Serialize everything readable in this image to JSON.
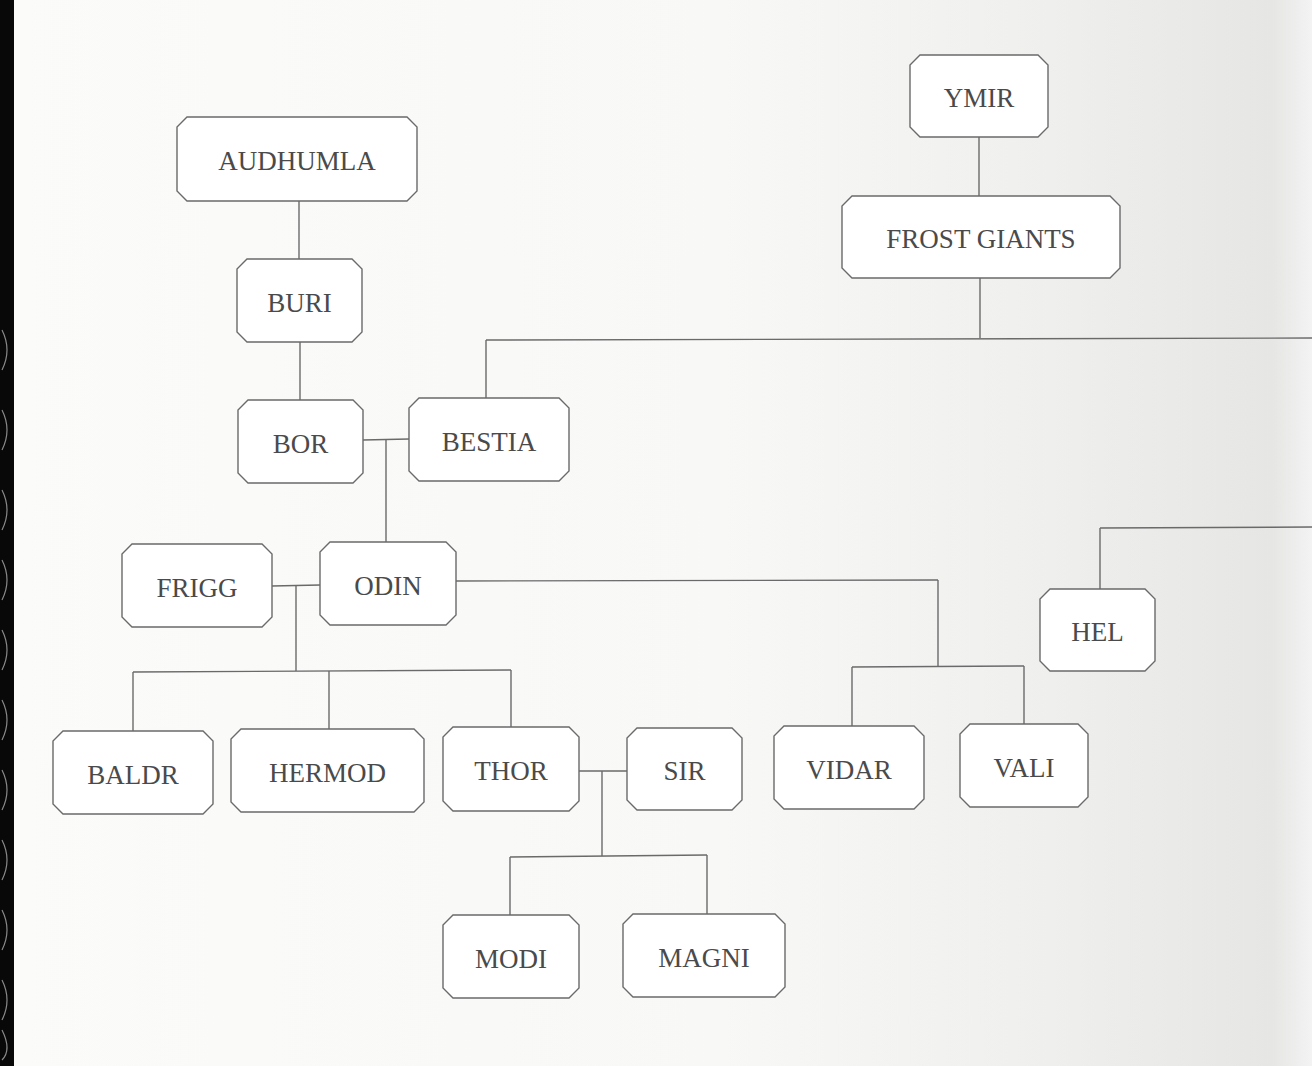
{
  "page": {
    "title_fragment": "",
    "content_type": "family tree diagram"
  },
  "nodes": [
    {
      "id": "ymir",
      "label": "YMIR"
    },
    {
      "id": "frost-giants",
      "label": "FROST GIANTS"
    },
    {
      "id": "audhumla",
      "label": "AUDHUMLA"
    },
    {
      "id": "buri",
      "label": "BURI"
    },
    {
      "id": "bor",
      "label": "BOR"
    },
    {
      "id": "bestia",
      "label": "BESTIA"
    },
    {
      "id": "frigg",
      "label": "FRIGG"
    },
    {
      "id": "odin",
      "label": "ODIN"
    },
    {
      "id": "hel",
      "label": "HEL"
    },
    {
      "id": "baldr",
      "label": "BALDR"
    },
    {
      "id": "hermod",
      "label": "HERMOD"
    },
    {
      "id": "thor",
      "label": "THOR"
    },
    {
      "id": "sir",
      "label": "SIR"
    },
    {
      "id": "vidar",
      "label": "VIDAR"
    },
    {
      "id": "vali",
      "label": "VALI"
    },
    {
      "id": "modi",
      "label": "MODI"
    },
    {
      "id": "magni",
      "label": "MAGNI"
    }
  ],
  "relations": [
    {
      "type": "parent-child",
      "parent": "ymir",
      "child": "frost-giants"
    },
    {
      "type": "parent-child",
      "parent": "audhumla",
      "child": "buri"
    },
    {
      "type": "parent-child",
      "parent": "buri",
      "child": "bor"
    },
    {
      "type": "parent-child",
      "parent": "frost-giants",
      "child": "bestia"
    },
    {
      "type": "parent-child",
      "parent": "frost-giants",
      "child": "(off-page)"
    },
    {
      "type": "union",
      "a": "bor",
      "b": "bestia"
    },
    {
      "type": "parent-child",
      "parent": "bor+bestia",
      "child": "odin"
    },
    {
      "type": "union",
      "a": "frigg",
      "b": "odin"
    },
    {
      "type": "parent-child",
      "parent": "frigg+odin",
      "child": "baldr"
    },
    {
      "type": "parent-child",
      "parent": "frigg+odin",
      "child": "hermod"
    },
    {
      "type": "parent-child",
      "parent": "frigg+odin",
      "child": "thor"
    },
    {
      "type": "parent-child",
      "parent": "odin",
      "child": "vidar"
    },
    {
      "type": "parent-child",
      "parent": "odin",
      "child": "vali"
    },
    {
      "type": "parent-child",
      "parent": "(off-page)",
      "child": "hel"
    },
    {
      "type": "union",
      "a": "thor",
      "b": "sir"
    },
    {
      "type": "parent-child",
      "parent": "thor+sir",
      "child": "modi"
    },
    {
      "type": "parent-child",
      "parent": "thor+sir",
      "child": "magni"
    }
  ]
}
